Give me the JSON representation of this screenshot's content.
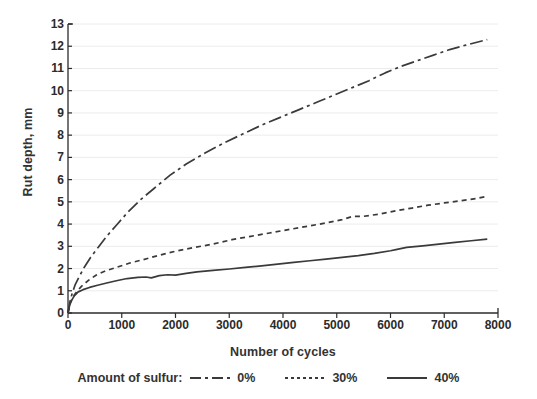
{
  "chart_data": {
    "type": "line",
    "title": "",
    "xlabel": "Number of cycles",
    "ylabel": "Rut depth, mm",
    "xlim": [
      0,
      8000
    ],
    "ylim": [
      0,
      13
    ],
    "xticks": [
      0,
      1000,
      2000,
      3000,
      4000,
      5000,
      6000,
      7000,
      8000
    ],
    "yticks": [
      0,
      1,
      2,
      3,
      4,
      5,
      6,
      7,
      8,
      9,
      10,
      11,
      12,
      13
    ],
    "grid": "horizontal-faint",
    "legend_position": "below-axis",
    "legend_title": "Amount of sulfur:",
    "series": [
      {
        "name": "0%",
        "style": "dash-dot",
        "color": "#3a3a3a",
        "x": [
          0,
          40,
          80,
          130,
          200,
          300,
          420,
          560,
          720,
          900,
          1100,
          1350,
          1600,
          1900,
          2200,
          2550,
          2900,
          3250,
          3600,
          3950,
          4300,
          4650,
          5000,
          5300,
          5600,
          5900,
          6200,
          6500,
          6800,
          7100,
          7400,
          7800
        ],
        "y": [
          0.0,
          0.55,
          0.9,
          1.25,
          1.6,
          2.05,
          2.5,
          2.95,
          3.45,
          3.95,
          4.5,
          5.1,
          5.6,
          6.2,
          6.7,
          7.2,
          7.65,
          8.05,
          8.45,
          8.8,
          9.15,
          9.5,
          9.85,
          10.15,
          10.45,
          10.8,
          11.1,
          11.35,
          11.6,
          11.85,
          12.05,
          12.3
        ]
      },
      {
        "name": "30%",
        "style": "dotted-dash",
        "color": "#3a3a3a",
        "x": [
          0,
          40,
          90,
          160,
          250,
          370,
          520,
          700,
          900,
          1150,
          1400,
          1700,
          2000,
          2350,
          2700,
          3050,
          3400,
          3750,
          4100,
          4450,
          4800,
          5100,
          5300,
          5500,
          5800,
          6100,
          6400,
          6700,
          7000,
          7300,
          7600,
          7800
        ],
        "y": [
          0.0,
          0.45,
          0.72,
          0.95,
          1.2,
          1.45,
          1.7,
          1.9,
          2.05,
          2.25,
          2.4,
          2.6,
          2.78,
          2.95,
          3.1,
          3.3,
          3.45,
          3.6,
          3.75,
          3.9,
          4.05,
          4.2,
          4.35,
          4.35,
          4.45,
          4.6,
          4.72,
          4.85,
          4.95,
          5.05,
          5.15,
          5.25
        ]
      },
      {
        "name": "40%",
        "style": "solid",
        "color": "#3a3a3a",
        "x": [
          0,
          30,
          70,
          120,
          190,
          280,
          400,
          550,
          720,
          900,
          1100,
          1300,
          1450,
          1550,
          1700,
          1850,
          2000,
          2200,
          2400,
          2700,
          3000,
          3300,
          3600,
          3900,
          4200,
          4500,
          4800,
          5100,
          5400,
          5700,
          6000,
          6100,
          6300,
          6600,
          6900,
          7200,
          7500,
          7800
        ],
        "y": [
          0.0,
          0.35,
          0.58,
          0.78,
          0.95,
          1.05,
          1.15,
          1.25,
          1.35,
          1.45,
          1.55,
          1.6,
          1.62,
          1.58,
          1.68,
          1.72,
          1.7,
          1.78,
          1.85,
          1.92,
          1.98,
          2.05,
          2.12,
          2.2,
          2.28,
          2.35,
          2.42,
          2.5,
          2.58,
          2.68,
          2.8,
          2.85,
          2.95,
          3.02,
          3.1,
          3.18,
          3.25,
          3.32
        ]
      }
    ]
  },
  "axes": {
    "y_title": "Rut depth, mm",
    "x_title": "Number of cycles",
    "y_tick_labels": [
      "13",
      "12",
      "11",
      "10",
      "9",
      "8",
      "7",
      "6",
      "5",
      "4",
      "3",
      "2",
      "1",
      "0"
    ],
    "x_tick_labels": [
      "0",
      "1000",
      "2000",
      "3000",
      "4000",
      "5000",
      "6000",
      "7000",
      "8000"
    ]
  },
  "legend": {
    "title": "Amount of sulfur:",
    "entries": [
      {
        "label": "0%",
        "style": "dash-dot"
      },
      {
        "label": "30%",
        "style": "dotted"
      },
      {
        "label": "40%",
        "style": "solid"
      }
    ]
  },
  "colors": {
    "ink": "#3a3a3a",
    "axis": "#2b2b2b",
    "grid": "#ececec",
    "background": "#ffffff"
  }
}
